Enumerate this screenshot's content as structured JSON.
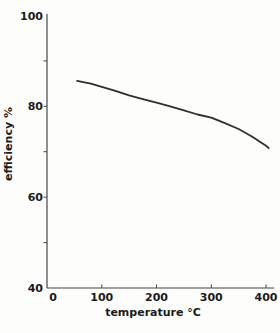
{
  "figure": {
    "background": "#fdfdfc"
  },
  "chart_data": {
    "type": "line",
    "title": "",
    "xlabel": "temperature °C",
    "ylabel": "efficiency %",
    "x_ticks": [
      0,
      100,
      200,
      300,
      400
    ],
    "y_ticks": [
      40,
      60,
      80,
      100
    ],
    "y_minor_ticks": [
      50,
      60,
      70,
      80,
      90
    ],
    "xlim": [
      0,
      415
    ],
    "ylim": [
      40,
      100
    ],
    "grid": false,
    "legend": "none",
    "series": [
      {
        "name": "efficiency",
        "x": [
          55,
          80,
          100,
          125,
          150,
          175,
          200,
          225,
          250,
          275,
          300,
          325,
          350,
          375,
          400,
          405
        ],
        "y": [
          85.6,
          85.0,
          84.3,
          83.4,
          82.4,
          81.6,
          80.8,
          80.0,
          79.1,
          78.2,
          77.5,
          76.3,
          75.0,
          73.3,
          71.3,
          70.8
        ]
      }
    ],
    "colors": {
      "line": "#2e2e2e",
      "axis": "#454545",
      "text": "#1b1b1b"
    }
  }
}
